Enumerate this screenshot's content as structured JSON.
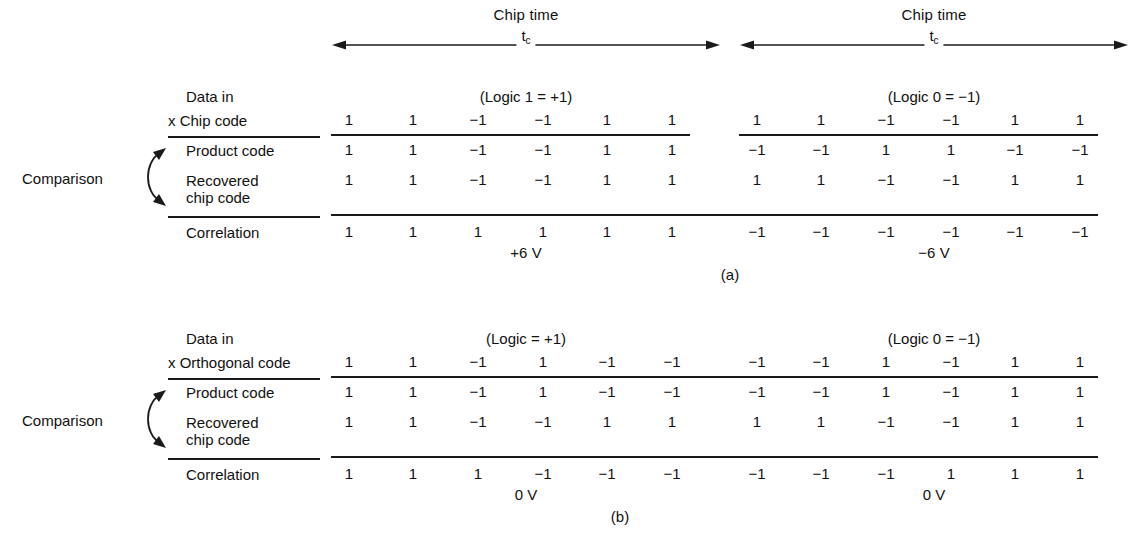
{
  "figure": {
    "caption_a": "(a)",
    "caption_b": "(b)",
    "chip_time_title": "Chip time",
    "tc_symbol": "t",
    "tc_subscript": "c"
  },
  "panel_a": {
    "caption": "(a)",
    "comparison_label": "Comparison",
    "row_labels": {
      "data_in": "Data in",
      "code": "x Chip code",
      "product": "Product code",
      "recovered_line1": "Recovered",
      "recovered_line2": "chip code",
      "correlation": "Correlation"
    },
    "groups": [
      {
        "logic_caption": "(Logic 1 = +1)",
        "voltage": "+6 V",
        "code": [
          "1",
          "1",
          "−1",
          "−1",
          "1",
          "1"
        ],
        "product": [
          "1",
          "1",
          "−1",
          "−1",
          "1",
          "1"
        ],
        "recovered": [
          "1",
          "1",
          "−1",
          "−1",
          "1",
          "1"
        ],
        "correlation": [
          "1",
          "1",
          "1",
          "1",
          "1",
          "1"
        ]
      },
      {
        "logic_caption": "(Logic 0 = −1)",
        "voltage": "−6 V",
        "code": [
          "1",
          "1",
          "−1",
          "−1",
          "1",
          "1"
        ],
        "product": [
          "−1",
          "−1",
          "1",
          "1",
          "−1",
          "−1"
        ],
        "recovered": [
          "1",
          "1",
          "−1",
          "−1",
          "1",
          "1"
        ],
        "correlation": [
          "−1",
          "−1",
          "−1",
          "−1",
          "−1",
          "−1"
        ]
      }
    ]
  },
  "panel_b": {
    "caption": "(b)",
    "comparison_label": "Comparison",
    "row_labels": {
      "data_in": "Data in",
      "code": "x Orthogonal code",
      "product": "Product code",
      "recovered_line1": "Recovered",
      "recovered_line2": "chip code",
      "correlation": "Correlation"
    },
    "groups": [
      {
        "logic_caption": "(Logic = +1)",
        "voltage": "0 V",
        "code": [
          "1",
          "1",
          "−1",
          "1",
          "−1",
          "−1"
        ],
        "product": [
          "1",
          "1",
          "−1",
          "1",
          "−1",
          "−1"
        ],
        "recovered": [
          "1",
          "1",
          "−1",
          "−1",
          "1",
          "1"
        ],
        "correlation": [
          "1",
          "1",
          "1",
          "−1",
          "−1",
          "−1"
        ]
      },
      {
        "logic_caption": "(Logic 0 = −1)",
        "voltage": "0 V",
        "code": [
          "−1",
          "−1",
          "1",
          "−1",
          "1",
          "1"
        ],
        "product": [
          "−1",
          "−1",
          "1",
          "−1",
          "1",
          "1"
        ],
        "recovered": [
          "1",
          "1",
          "−1",
          "−1",
          "1",
          "1"
        ],
        "correlation": [
          "−1",
          "−1",
          "−1",
          "1",
          "1",
          "1"
        ]
      }
    ]
  },
  "chart_data": {
    "type": "table",
    "column_headers": [
      "Chip 1",
      "Chip 2",
      "Chip 3",
      "Chip 4",
      "Chip 5",
      "Chip 6"
    ],
    "panels": [
      {
        "name": "(a) Matched chip code",
        "groups": [
          {
            "logic": "(Logic 1 = +1)",
            "result_voltage": "+6 V",
            "rows": [
              {
                "label": "x Chip code",
                "values": [
                  1,
                  1,
                  -1,
                  -1,
                  1,
                  1
                ]
              },
              {
                "label": "Product code",
                "values": [
                  1,
                  1,
                  -1,
                  -1,
                  1,
                  1
                ]
              },
              {
                "label": "Recovered chip code",
                "values": [
                  1,
                  1,
                  -1,
                  -1,
                  1,
                  1
                ]
              },
              {
                "label": "Correlation",
                "values": [
                  1,
                  1,
                  1,
                  1,
                  1,
                  1
                ]
              }
            ]
          },
          {
            "logic": "(Logic 0 = -1)",
            "result_voltage": "-6 V",
            "rows": [
              {
                "label": "x Chip code",
                "values": [
                  1,
                  1,
                  -1,
                  -1,
                  1,
                  1
                ]
              },
              {
                "label": "Product code",
                "values": [
                  -1,
                  -1,
                  1,
                  1,
                  -1,
                  -1
                ]
              },
              {
                "label": "Recovered chip code",
                "values": [
                  1,
                  1,
                  -1,
                  -1,
                  1,
                  1
                ]
              },
              {
                "label": "Correlation",
                "values": [
                  -1,
                  -1,
                  -1,
                  -1,
                  -1,
                  -1
                ]
              }
            ]
          }
        ]
      },
      {
        "name": "(b) Orthogonal code",
        "groups": [
          {
            "logic": "(Logic = +1)",
            "result_voltage": "0 V",
            "rows": [
              {
                "label": "x Orthogonal code",
                "values": [
                  1,
                  1,
                  -1,
                  1,
                  -1,
                  -1
                ]
              },
              {
                "label": "Product code",
                "values": [
                  1,
                  1,
                  -1,
                  1,
                  -1,
                  -1
                ]
              },
              {
                "label": "Recovered chip code",
                "values": [
                  1,
                  1,
                  -1,
                  -1,
                  1,
                  1
                ]
              },
              {
                "label": "Correlation",
                "values": [
                  1,
                  1,
                  1,
                  -1,
                  -1,
                  -1
                ]
              }
            ]
          },
          {
            "logic": "(Logic 0 = -1)",
            "result_voltage": "0 V",
            "rows": [
              {
                "label": "x Orthogonal code",
                "values": [
                  -1,
                  -1,
                  1,
                  -1,
                  1,
                  1
                ]
              },
              {
                "label": "Product code",
                "values": [
                  -1,
                  -1,
                  1,
                  -1,
                  1,
                  1
                ]
              },
              {
                "label": "Recovered chip code",
                "values": [
                  1,
                  1,
                  -1,
                  -1,
                  1,
                  1
                ]
              },
              {
                "label": "Correlation",
                "values": [
                  -1,
                  -1,
                  -1,
                  1,
                  1,
                  1
                ]
              }
            ]
          }
        ]
      }
    ]
  }
}
